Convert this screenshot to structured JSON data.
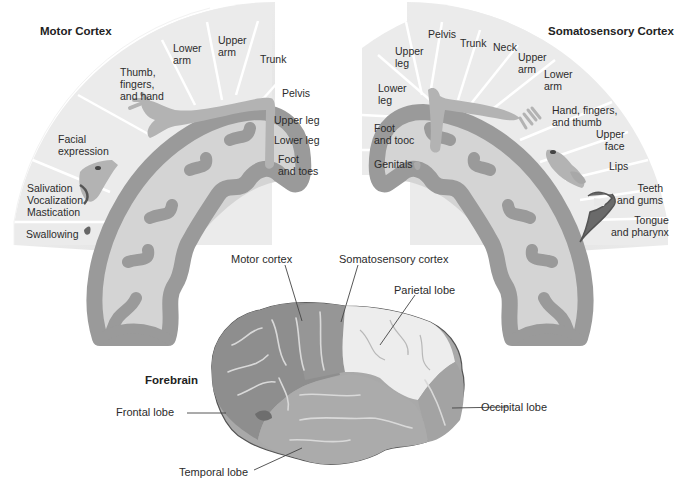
{
  "motor_cortex": {
    "title": "Motor Cortex",
    "segments": [
      {
        "label": "Swallowing"
      },
      {
        "label": "Salivation\nVocalization\nMastication"
      },
      {
        "label": "Facial\nexpression"
      },
      {
        "label": "Thumb,\nfingers,\nand hand"
      },
      {
        "label": "Lower\narm"
      },
      {
        "label": "Upper\narm"
      },
      {
        "label": "Trunk"
      },
      {
        "label": "Pelvis"
      },
      {
        "label": "Upper leg"
      },
      {
        "label": "Lower leg"
      },
      {
        "label": "Foot\nand toes"
      }
    ]
  },
  "somatosensory_cortex": {
    "title": "Somatosensory Cortex",
    "segments": [
      {
        "label": "Genitals"
      },
      {
        "label": "Foot\nand tooc"
      },
      {
        "label": "Lower\nleg"
      },
      {
        "label": "Upper\nleg"
      },
      {
        "label": "Pelvis"
      },
      {
        "label": "Trunk"
      },
      {
        "label": "Neck"
      },
      {
        "label": "Upper\narm"
      },
      {
        "label": "Lower\narm"
      },
      {
        "label": "Hand, fingers,\nand thumb"
      },
      {
        "label": "Upper\nface"
      },
      {
        "label": "Lips"
      },
      {
        "label": "Teeth\nand gums"
      },
      {
        "label": "Tongue\nand pharynx"
      }
    ]
  },
  "forebrain": {
    "title": "Forebrain",
    "labels": {
      "motor_cortex": "Motor cortex",
      "somatosensory_cortex": "Somatosensory cortex",
      "parietal_lobe": "Parietal lobe",
      "frontal_lobe": "Frontal lobe",
      "occipital_lobe": "Occipital lobe",
      "temporal_lobe": "Temporal lobe"
    }
  },
  "colors": {
    "fan_light": "#e9e9e9",
    "fan_lighter": "#f0f0f0",
    "cortex_gray": "#9a9a9a",
    "white_matter": "#d4d4d4",
    "homunculus": "#b0b0b0",
    "frontal": "#8e8e8e",
    "parietal": "#ededed",
    "temporal": "#a9a9a9",
    "occipital": "#a3a3a3",
    "dark_feature": "#6a6a6a"
  }
}
